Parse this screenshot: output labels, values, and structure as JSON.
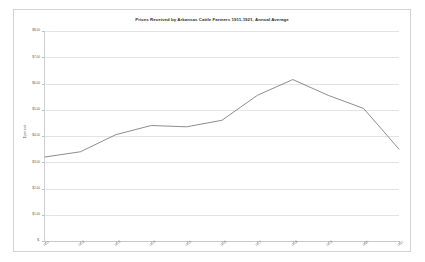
{
  "chart_data": {
    "type": "line",
    "title": "Prices Received by Arkansas Cattle Farmers 1911-1921, Annual Average",
    "xlabel": "",
    "ylabel": "$ per cwt.",
    "categories": [
      "1911",
      "1912",
      "1913",
      "1914",
      "1915",
      "1916",
      "1917",
      "1918",
      "1919",
      "1920",
      "1921"
    ],
    "series": [
      {
        "name": "Annual Average Price",
        "values": [
          3.2,
          3.4,
          4.05,
          4.4,
          4.35,
          4.6,
          5.55,
          6.15,
          5.55,
          5.05,
          3.5
        ]
      }
    ],
    "ylim": [
      0,
      8
    ],
    "ytick_values": [
      0,
      1,
      2,
      3,
      4,
      5,
      6,
      7,
      8
    ],
    "ytick_labels": [
      "$-",
      "$1.00",
      "$2.00",
      "$3.00",
      "$4.00",
      "$5.00",
      "$6.00",
      "$7.00",
      "$8.00"
    ],
    "grid": true,
    "legend": false,
    "line_color": "#808080"
  },
  "colors": {
    "frame_border": "#d4d4d4",
    "gridline": "#e3e3e3",
    "axis": "#c9c9c9",
    "text": "#575757",
    "title": "#2e2e2e",
    "plot_background": "#ffffff"
  }
}
